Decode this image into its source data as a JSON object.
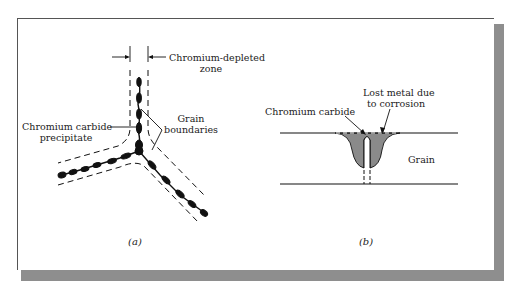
{
  "figure": {
    "panel_a": {
      "caption": "(a)",
      "labels": {
        "depleted_zone_line1": "Chromium-depleted",
        "depleted_zone_line2": "zone",
        "precipitate_line1": "Chromium carbide",
        "precipitate_line2": "precipitate",
        "boundaries_line1": "Grain",
        "boundaries_line2": "boundaries"
      }
    },
    "panel_b": {
      "caption": "(b)",
      "labels": {
        "carbide": "Chromium carbide",
        "lost_metal_line1": "Lost metal due",
        "lost_metal_line2": "to corrosion",
        "grain": "Grain"
      }
    },
    "colors": {
      "frame_shadow": "#8e8e8e",
      "corroded_region": "#8a8a8a",
      "ink": "#111111"
    }
  }
}
